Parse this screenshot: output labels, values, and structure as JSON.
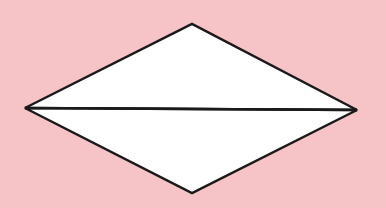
{
  "diagram": {
    "background_color": "#f6c3c6",
    "shape": "rhombus-divided-by-horizontal-diagonal",
    "fill_color": "#ffffff",
    "stroke_color": "#1a1a1a",
    "vertices": {
      "top": [
        192,
        24
      ],
      "right": [
        357,
        110
      ],
      "bottom": [
        192,
        193
      ],
      "left": [
        25,
        108
      ]
    },
    "triangles": [
      {
        "name": "upper-triangle",
        "points": "25,108 192,24 357,110"
      },
      {
        "name": "lower-triangle",
        "points": "25,108 357,110 192,193"
      }
    ],
    "diagonal": {
      "x1": 25,
      "y1": 108,
      "x2": 357,
      "y2": 110
    }
  }
}
